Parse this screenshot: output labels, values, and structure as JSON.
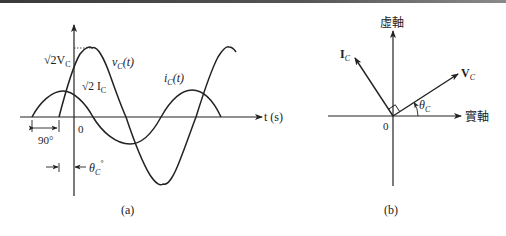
{
  "panel_a": {
    "caption": "(a)",
    "x_axis_label": "t (s)",
    "origin_label": "0",
    "voltage_peak_label": "√2V",
    "voltage_peak_sub": "C",
    "current_peak_label": "√2 I",
    "current_peak_sub": "C",
    "voltage_curve_label": "v",
    "voltage_curve_sub": "C",
    "voltage_curve_arg": "(t)",
    "current_curve_label": "i",
    "current_curve_sub": "C",
    "current_curve_arg": "(t)",
    "phase_gap_label": "90°",
    "theta_label": "θ",
    "theta_sub": "C",
    "theta_deg": "°"
  },
  "panel_b": {
    "caption": "(b)",
    "imag_axis_label": "虛軸",
    "real_axis_label": "實軸",
    "origin_label": "0",
    "current_phasor_label": "I",
    "current_phasor_sub": "C",
    "voltage_phasor_label": "V",
    "voltage_phasor_sub": "C",
    "angle_label": "θ",
    "angle_sub": "C"
  },
  "colors": {
    "ink": "#222222",
    "background": "#ffffff"
  }
}
